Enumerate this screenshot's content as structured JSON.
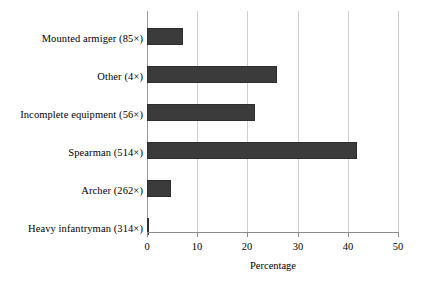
{
  "chart_data": {
    "type": "bar",
    "orientation": "horizontal",
    "title": "",
    "xlabel": "Percentage",
    "ylabel": "",
    "xlim": [
      0,
      50
    ],
    "xticks": [
      0,
      10,
      20,
      30,
      40,
      50
    ],
    "xticklabels": [
      "0",
      "10",
      "20",
      "30",
      "40",
      "50"
    ],
    "grid": "vertical",
    "legend": "none",
    "bar_color": "#3b3b3b",
    "categories": [
      "Heavy infantryman (314×)",
      "Archer (262×)",
      "Spearman (514×)",
      "Incomplete equipment (56×)",
      "Other (4×)",
      "Mounted armiger (85×)"
    ],
    "values": [
      0.3,
      4.8,
      41.8,
      21.5,
      25.9,
      7.2
    ],
    "bars": [
      {
        "label": "Mounted armiger (85×)",
        "count": 85,
        "value": 7.2
      },
      {
        "label": "Other (4×)",
        "count": 4,
        "value": 25.9
      },
      {
        "label": "Incomplete equipment (56×)",
        "count": 56,
        "value": 21.5
      },
      {
        "label": "Spearman (514×)",
        "count": 514,
        "value": 41.8
      },
      {
        "label": "Archer (262×)",
        "count": 262,
        "value": 4.8
      },
      {
        "label": "Heavy infantryman (314×)",
        "count": 314,
        "value": 0.3
      }
    ]
  }
}
